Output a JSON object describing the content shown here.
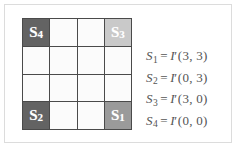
{
  "figure": {
    "background_color": "#ffffff",
    "frame_color": "#dcdcdc"
  },
  "grid": {
    "rows": 4,
    "cols": 4,
    "line_color": "#4a4a4a",
    "empty_cell_color": "#fbfbfb",
    "cells": [
      {
        "label": "S",
        "sub": "4",
        "shade": "dark",
        "color": "#636363",
        "row": 0,
        "col": 0
      },
      {
        "label": "",
        "sub": "",
        "shade": "empty",
        "color": "#fbfbfb",
        "row": 0,
        "col": 1
      },
      {
        "label": "",
        "sub": "",
        "shade": "empty",
        "color": "#fbfbfb",
        "row": 0,
        "col": 2
      },
      {
        "label": "S",
        "sub": "3",
        "shade": "light",
        "color": "#c9c9c9",
        "row": 0,
        "col": 3
      },
      {
        "label": "",
        "sub": "",
        "shade": "empty",
        "color": "#fbfbfb",
        "row": 1,
        "col": 0
      },
      {
        "label": "",
        "sub": "",
        "shade": "empty",
        "color": "#fbfbfb",
        "row": 1,
        "col": 1
      },
      {
        "label": "",
        "sub": "",
        "shade": "empty",
        "color": "#fbfbfb",
        "row": 1,
        "col": 2
      },
      {
        "label": "",
        "sub": "",
        "shade": "empty",
        "color": "#fbfbfb",
        "row": 1,
        "col": 3
      },
      {
        "label": "",
        "sub": "",
        "shade": "empty",
        "color": "#fbfbfb",
        "row": 2,
        "col": 0
      },
      {
        "label": "",
        "sub": "",
        "shade": "empty",
        "color": "#fbfbfb",
        "row": 2,
        "col": 1
      },
      {
        "label": "",
        "sub": "",
        "shade": "empty",
        "color": "#fbfbfb",
        "row": 2,
        "col": 2
      },
      {
        "label": "",
        "sub": "",
        "shade": "empty",
        "color": "#fbfbfb",
        "row": 2,
        "col": 3
      },
      {
        "label": "S",
        "sub": "2",
        "shade": "dark",
        "color": "#636363",
        "row": 3,
        "col": 0
      },
      {
        "label": "",
        "sub": "",
        "shade": "empty",
        "color": "#fbfbfb",
        "row": 3,
        "col": 1
      },
      {
        "label": "",
        "sub": "",
        "shade": "empty",
        "color": "#fbfbfb",
        "row": 3,
        "col": 2
      },
      {
        "label": "S",
        "sub": "1",
        "shade": "mid",
        "color": "#9a9a9a",
        "row": 3,
        "col": 3
      }
    ]
  },
  "equations": [
    {
      "lhs": "S",
      "lhs_sub": "1",
      "eq": "=",
      "fn": "I",
      "prime": "′",
      "args": "(3, 3)"
    },
    {
      "lhs": "S",
      "lhs_sub": "2",
      "eq": "=",
      "fn": "I",
      "prime": "′",
      "args": "(0, 3)"
    },
    {
      "lhs": "S",
      "lhs_sub": "3",
      "eq": "=",
      "fn": "I",
      "prime": "′",
      "args": "(3, 0)"
    },
    {
      "lhs": "S",
      "lhs_sub": "4",
      "eq": "=",
      "fn": "I",
      "prime": "′",
      "args": "(0, 0)"
    }
  ]
}
